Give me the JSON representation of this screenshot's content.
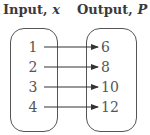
{
  "titles": {
    "input_label": "Input, ",
    "input_var": "x",
    "output_label": "Output, ",
    "output_var": "P"
  },
  "mapping": [
    {
      "input": "1",
      "output": "6"
    },
    {
      "input": "2",
      "output": "8"
    },
    {
      "input": "3",
      "output": "10"
    },
    {
      "input": "4",
      "output": "12"
    }
  ],
  "colors": {
    "line": "#333333",
    "text": "#555555",
    "title": "#3a3a3a"
  }
}
